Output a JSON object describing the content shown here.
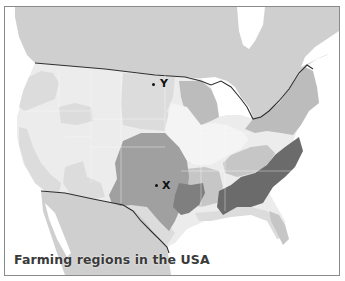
{
  "map": {
    "title": "Farming regions in the USA",
    "markers": [
      {
        "id": "Y",
        "label": "Y"
      },
      {
        "id": "X",
        "label": "X"
      }
    ],
    "colors": {
      "water": "#ffffff",
      "canada_mexico": "#cfcfcf",
      "light_region": "#ececec",
      "pale_region": "#dcdcdc",
      "mid_region": "#bcbcbc",
      "medium_dark_region": "#a0a0a0",
      "dark_region": "#7f7f7f",
      "darkest_region": "#6b6b6b",
      "border_line": "#2e2e2e"
    }
  }
}
